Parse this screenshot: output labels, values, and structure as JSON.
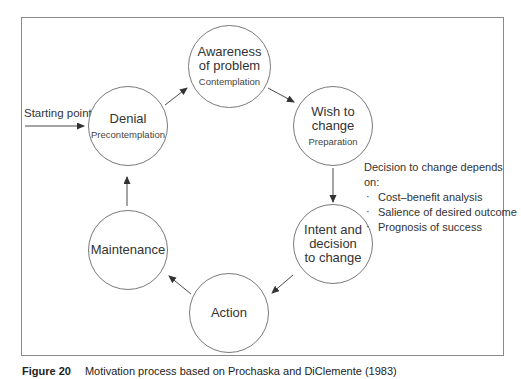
{
  "diagram": {
    "start_label": "Starting point:",
    "nodes": [
      {
        "id": "denial",
        "title": "Denial",
        "subtitle": "Precontemplation"
      },
      {
        "id": "awareness",
        "title": "Awareness of problem",
        "subtitle": "Contemplation"
      },
      {
        "id": "wish",
        "title": "Wish to change",
        "subtitle": "Preparation"
      },
      {
        "id": "intent",
        "title": "Intent and decision to change",
        "subtitle": ""
      },
      {
        "id": "action",
        "title": "Action",
        "subtitle": ""
      },
      {
        "id": "maintenance",
        "title": "Maintenance",
        "subtitle": ""
      }
    ],
    "edges": [
      {
        "from": "start",
        "to": "denial"
      },
      {
        "from": "denial",
        "to": "awareness"
      },
      {
        "from": "awareness",
        "to": "wish"
      },
      {
        "from": "wish",
        "to": "intent"
      },
      {
        "from": "intent",
        "to": "action"
      },
      {
        "from": "action",
        "to": "maintenance"
      },
      {
        "from": "maintenance",
        "to": "denial"
      }
    ],
    "factors": {
      "heading": "Decision to change depends on:",
      "items": [
        "Cost–benefit analysis",
        "Salience of desired outcome",
        "Prognosis of success"
      ]
    }
  },
  "caption": {
    "figure": "Figure 20",
    "text": "Motivation process based on Prochaska and DiClemente (1983)"
  },
  "colors": {
    "line": "#4a4a4a",
    "circle": "#7a7a7a",
    "frame": "#8a8a8a"
  }
}
